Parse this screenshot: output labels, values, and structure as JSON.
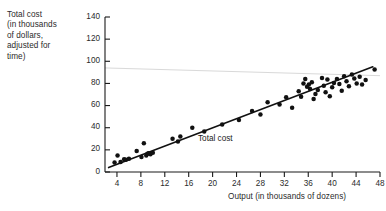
{
  "chart_data": {
    "type": "scatter",
    "title": "",
    "xlabel": "Output (in thousands of dozens)",
    "ylabel": "Total cost (in thousands of dollars, adjusted for time)",
    "ylabel_lines": [
      "Total cost",
      "(in thousands",
      "of dollars,",
      "adjusted for",
      "time)"
    ],
    "xlim": [
      2,
      48
    ],
    "ylim": [
      0,
      140
    ],
    "xticks": [
      4,
      8,
      12,
      16,
      20,
      24,
      28,
      32,
      36,
      40,
      44,
      48
    ],
    "yticks": [
      0,
      20,
      40,
      60,
      80,
      100,
      120,
      140
    ],
    "xtick_labels": [
      "4",
      "8",
      "12",
      "16",
      "20",
      "24",
      "28",
      "32",
      "36",
      "40",
      "44",
      "48"
    ],
    "ytick_labels": [
      "0",
      "20",
      "40",
      "60",
      "80",
      "100",
      "120",
      "140"
    ],
    "grid": false,
    "legend": null,
    "annotations": [
      {
        "text": "Total cost",
        "x": 20.5,
        "y": 25.0,
        "name": "regression-line-label"
      }
    ],
    "series": [
      {
        "name": "Total cost",
        "marker": "filled-circle",
        "color": "#111111",
        "points": [
          [
            3.6,
            8.5
          ],
          [
            4.1,
            15.0
          ],
          [
            4.6,
            9.0
          ],
          [
            5.2,
            11.5
          ],
          [
            5.5,
            11.0
          ],
          [
            6.0,
            12.0
          ],
          [
            7.3,
            19.0
          ],
          [
            8.1,
            13.5
          ],
          [
            8.5,
            26.0
          ],
          [
            8.9,
            15.0
          ],
          [
            9.1,
            16.5
          ],
          [
            9.3,
            17.0
          ],
          [
            9.6,
            16.0
          ],
          [
            10.0,
            17.5
          ],
          [
            13.3,
            30.0
          ],
          [
            14.2,
            27.5
          ],
          [
            14.6,
            32.0
          ],
          [
            16.6,
            40.0
          ],
          [
            18.6,
            36.5
          ],
          [
            21.6,
            43.0
          ],
          [
            24.4,
            47.0
          ],
          [
            26.6,
            55.0
          ],
          [
            28.0,
            52.0
          ],
          [
            29.2,
            63.0
          ],
          [
            31.2,
            61.0
          ],
          [
            32.3,
            67.5
          ],
          [
            33.3,
            58.0
          ],
          [
            34.4,
            73.0
          ],
          [
            34.8,
            68.0
          ],
          [
            35.2,
            80.0
          ],
          [
            35.5,
            84.0
          ],
          [
            35.8,
            77.0
          ],
          [
            36.1,
            79.0
          ],
          [
            36.3,
            75.0
          ],
          [
            36.6,
            81.0
          ],
          [
            36.9,
            66.0
          ],
          [
            37.2,
            70.5
          ],
          [
            37.6,
            74.0
          ],
          [
            38.3,
            85.0
          ],
          [
            38.6,
            78.0
          ],
          [
            38.9,
            72.0
          ],
          [
            39.2,
            83.5
          ],
          [
            39.6,
            68.5
          ],
          [
            40.0,
            76.5
          ],
          [
            40.3,
            80.5
          ],
          [
            40.8,
            84.0
          ],
          [
            41.2,
            79.5
          ],
          [
            41.6,
            73.5
          ],
          [
            42.0,
            86.5
          ],
          [
            42.4,
            82.0
          ],
          [
            42.8,
            77.5
          ],
          [
            43.3,
            88.0
          ],
          [
            43.7,
            84.5
          ],
          [
            44.1,
            80.0
          ],
          [
            44.6,
            86.0
          ],
          [
            45.0,
            79.0
          ],
          [
            45.6,
            83.0
          ],
          [
            47.1,
            92.5
          ]
        ]
      }
    ],
    "fit_line": {
      "name": "Total cost regression line",
      "x_start": 2.6,
      "y_start": 4.0,
      "x_end": 46.8,
      "y_end": 95.0,
      "color": "#111111"
    },
    "artifact_line": {
      "name": "scan-artifact-line",
      "color": "#d9d9d9",
      "x_start": 2.0,
      "y_start": 94.0,
      "x_end": 48.0,
      "y_end": 87.0
    }
  }
}
